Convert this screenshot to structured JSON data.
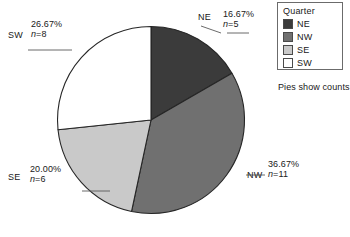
{
  "chart_data": {
    "type": "pie",
    "title": "",
    "subtitle": "",
    "categories": [
      "NE",
      "NW",
      "SE",
      "SW"
    ],
    "values": [
      5,
      11,
      6,
      8
    ],
    "percents": [
      "16.67%",
      "36.67%",
      "20.00%",
      "26.67%"
    ],
    "percent_values": [
      16.67,
      36.67,
      20.0,
      26.67
    ],
    "count_labels": [
      "n=5",
      "n=11",
      "n=6",
      "n=8"
    ],
    "total": 30,
    "slice_colors": [
      "#3b3b3b",
      "#707070",
      "#c9c9c9",
      "#ffffff"
    ],
    "start_angle_deg": 0,
    "direction": "clockwise",
    "legend_position": "right",
    "legend_title": "Quarter",
    "footnote": "Pies show counts",
    "grid": false,
    "xlabel": "",
    "ylabel": ""
  },
  "pie": {
    "outline_color": "#262626",
    "slices": [
      {
        "key": "NE",
        "label": "NE",
        "percent": "16.67%",
        "count": "n=5",
        "count_prefix": "n",
        "count_suffix": "=5",
        "color": "#3b3b3b"
      },
      {
        "key": "NW",
        "label": "NW",
        "percent": "36.67%",
        "count": "n=11",
        "count_prefix": "n",
        "count_suffix": "=11",
        "color": "#707070"
      },
      {
        "key": "SE",
        "label": "SE",
        "percent": "20.00%",
        "count": "n=6",
        "count_prefix": "n",
        "count_suffix": "=6",
        "color": "#c9c9c9"
      },
      {
        "key": "SW",
        "label": "SW",
        "percent": "26.67%",
        "count": "n=8",
        "count_prefix": "n",
        "count_suffix": "=8",
        "color": "#ffffff"
      }
    ]
  },
  "legend": {
    "title": "Quarter",
    "items": [
      {
        "label": "NE",
        "color": "#3b3b3b"
      },
      {
        "label": "NW",
        "color": "#707070"
      },
      {
        "label": "SE",
        "color": "#c9c9c9"
      },
      {
        "label": "SW",
        "color": "#ffffff"
      }
    ],
    "footnote": "Pies show counts"
  }
}
